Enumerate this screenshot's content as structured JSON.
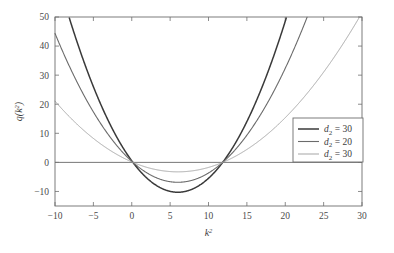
{
  "chart_data": {
    "type": "line",
    "title": "",
    "xlabel": "k^2",
    "ylabel": "q(k^2)",
    "xlim": [
      -10,
      30
    ],
    "ylim": [
      -15,
      50
    ],
    "grid": false,
    "legend_position": "center-right",
    "xticks": [
      -10,
      -5,
      0,
      5,
      10,
      15,
      20,
      25,
      30
    ],
    "xtick_labels": [
      "-10",
      "-5",
      "0",
      "5",
      "10",
      "15",
      "20",
      "25",
      "30"
    ],
    "yticks": [
      -10,
      0,
      10,
      20,
      30,
      40,
      50
    ],
    "ytick_labels": [
      "-10",
      "0",
      "10",
      "20",
      "30",
      "40",
      "50"
    ],
    "zero_line": 0,
    "series": [
      {
        "name": "d2 = 30",
        "legend_label": "d_2 = 30",
        "color": "#3a3a3a",
        "width": 1.5,
        "quadratic": {
          "a": 0.3,
          "root1": 0.15,
          "root2": 11.85
        },
        "vertex": {
          "x": 6.0,
          "y": -10.5
        },
        "points_x": [
          -10,
          -8,
          -6,
          -4,
          -2,
          0,
          2,
          4,
          6,
          8,
          10,
          12,
          14,
          16,
          18,
          20
        ],
        "points_y": [
          108.5,
          77.3,
          52.1,
          32.9,
          19.7,
          0.5,
          -6.5,
          -9.4,
          -10.5,
          -8.2,
          -3.0,
          0.6,
          12.1,
          28.9,
          51.7,
          80.5
        ]
      },
      {
        "name": "d2 = 20",
        "legend_label": "d_2 = 20",
        "color": "#6b6b6b",
        "width": 1.1,
        "quadratic": {
          "a": 0.2,
          "root1": 0.15,
          "root2": 11.85
        },
        "vertex": {
          "x": 6.0,
          "y": -7.0
        },
        "points_x": [
          -10,
          -8,
          -6,
          -4,
          -2,
          0,
          2,
          4,
          6,
          8,
          10,
          12,
          14,
          16,
          18,
          20,
          22.7
        ],
        "points_y": [
          45.0,
          32.6,
          21.9,
          13.0,
          5.8,
          0.3,
          -4.3,
          -6.3,
          -7.0,
          -5.5,
          -2.0,
          0.4,
          8.1,
          19.3,
          34.5,
          53.7,
          84.0
        ]
      },
      {
        "name": "d2 = 30 (light)",
        "legend_label": "d_2 = 30",
        "color": "#a5a5a5",
        "width": 1.0,
        "quadratic": {
          "a": 0.095,
          "root1": 0.15,
          "root2": 11.85
        },
        "vertex": {
          "x": 6.0,
          "y": -3.3
        },
        "points_x": [
          -10,
          -8,
          -6,
          -4,
          -2,
          0,
          2,
          4,
          6,
          8,
          10,
          12,
          14,
          16,
          18,
          20,
          24,
          29
        ],
        "points_y": [
          22.5,
          15.5,
          10.4,
          6.2,
          2.8,
          0.1,
          -2.0,
          -3.0,
          -3.3,
          -2.6,
          -1.0,
          0.2,
          3.9,
          9.2,
          16.4,
          25.5,
          49.6,
          89.3
        ]
      }
    ],
    "legend": [
      {
        "label_base": "d",
        "label_sub": "2",
        "label_value": "= 30",
        "color": "#3a3a3a",
        "width": 1.5
      },
      {
        "label_base": "d",
        "label_sub": "2",
        "label_value": "= 20",
        "color": "#6b6b6b",
        "width": 1.1
      },
      {
        "label_base": "d",
        "label_sub": "2",
        "label_value": "= 30",
        "color": "#a5a5a5",
        "width": 1.0
      }
    ],
    "axis_label_y": {
      "base": "q(k",
      "sup": "2",
      "tail": ")"
    },
    "axis_label_x": {
      "base": "k",
      "sup": "2"
    }
  }
}
